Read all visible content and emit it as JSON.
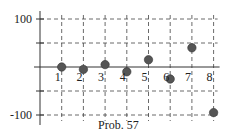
{
  "chart_data": {
    "type": "scatter",
    "title": "",
    "caption": "Prob. 57",
    "xlabel": "",
    "ylabel": "",
    "x": [
      1,
      2,
      3,
      4,
      5,
      6,
      7,
      8
    ],
    "values": [
      0,
      -5,
      5,
      -10,
      15,
      -25,
      40,
      -95
    ],
    "xticks": [
      "1",
      "2",
      "3",
      "4",
      "5",
      "6",
      "7",
      "8"
    ],
    "yticks": [
      "100",
      "-100"
    ],
    "xlim": [
      0,
      8
    ],
    "ylim": [
      -100,
      100
    ],
    "grid": "dashed, every 1 unit in x and 50 units in y",
    "legend": null,
    "marker_color": "#555555"
  }
}
